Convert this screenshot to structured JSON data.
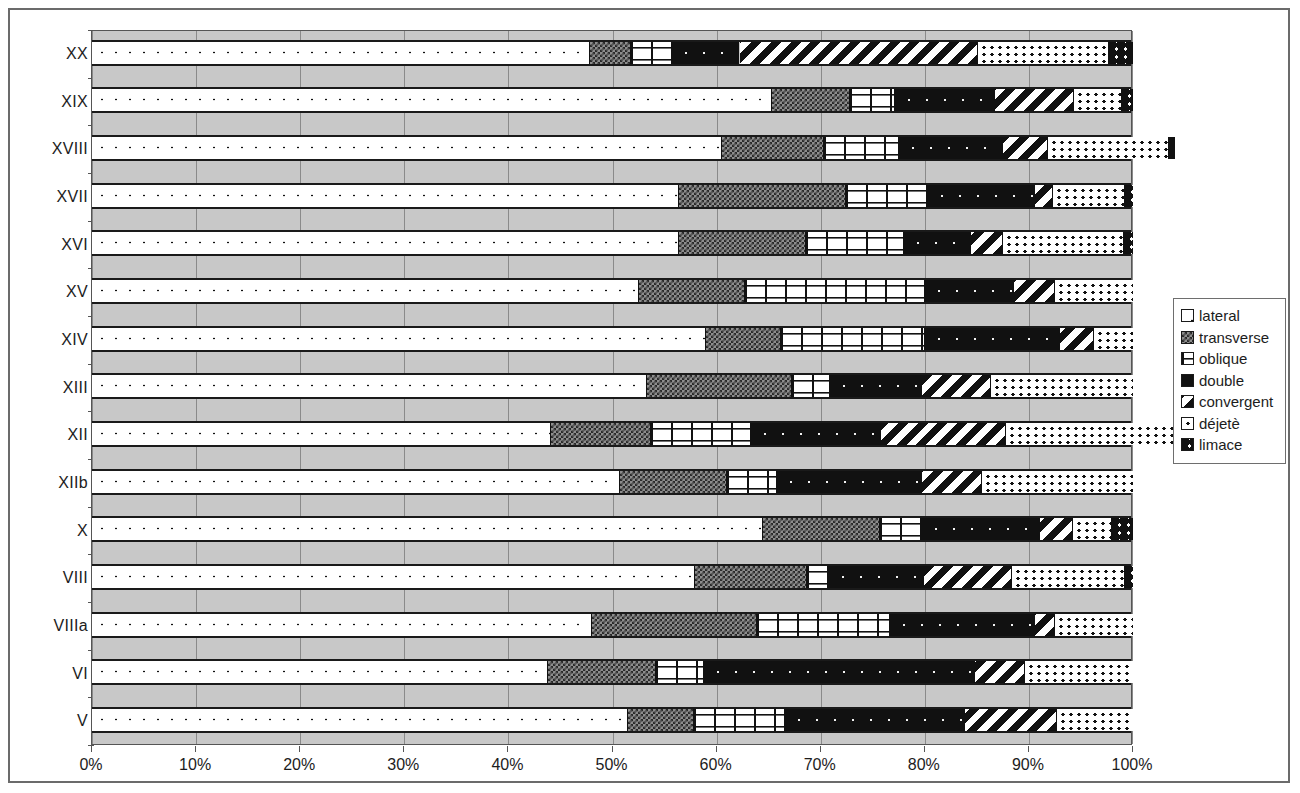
{
  "chart_data": {
    "type": "bar",
    "subtype": "stacked-percentage-horizontal",
    "title": "",
    "xlabel": "",
    "ylabel": "",
    "xlim": [
      0,
      100
    ],
    "xtick_labels": [
      "0%",
      "10%",
      "20%",
      "30%",
      "40%",
      "50%",
      "60%",
      "70%",
      "80%",
      "90%",
      "100%"
    ],
    "xticks": [
      0,
      10,
      20,
      30,
      40,
      50,
      60,
      70,
      80,
      90,
      100
    ],
    "grid": true,
    "legend_position": "right",
    "categories": [
      "XX",
      "XIX",
      "XVIII",
      "XVII",
      "XVI",
      "XV",
      "XIV",
      "XIII",
      "XII",
      "XIIb",
      "X",
      "VIII",
      "VIIIa",
      "VI",
      "V"
    ],
    "series": [
      {
        "name": "lateral",
        "pattern": "p-lateral",
        "values": [
          47.8,
          65.3,
          60.5,
          56.4,
          56.4,
          52.5,
          59.0,
          53.3,
          44.1,
          50.7,
          64.5,
          57.9,
          48.0,
          43.8,
          51.5
        ]
      },
      {
        "name": "transverse",
        "pattern": "p-transverse",
        "values": [
          4.0,
          7.5,
          9.8,
          16.0,
          12.2,
          10.2,
          7.2,
          13.9,
          9.6,
          10.3,
          11.2,
          10.8,
          15.9,
          10.4,
          6.3
        ]
      },
      {
        "name": "oblique",
        "pattern": "p-oblique",
        "values": [
          3.9,
          4.3,
          7.2,
          7.9,
          9.4,
          17.3,
          13.8,
          3.7,
          9.6,
          4.8,
          4.0,
          2.1,
          12.8,
          4.6,
          8.8
        ]
      },
      {
        "name": "double",
        "pattern": "p-double",
        "values": [
          6.5,
          9.6,
          10.0,
          10.3,
          6.4,
          8.6,
          13.0,
          8.8,
          12.5,
          13.9,
          11.4,
          9.1,
          13.9,
          26.0,
          17.3
        ]
      },
      {
        "name": "convergent",
        "pattern": "p-convergent",
        "values": [
          22.9,
          7.6,
          4.3,
          1.7,
          3.1,
          3.9,
          3.3,
          6.7,
          12.0,
          5.8,
          3.1,
          8.5,
          1.9,
          4.8,
          8.8
        ]
      },
      {
        "name": "déjetè",
        "pattern": "p-dejete",
        "values": [
          12.6,
          4.6,
          11.7,
          6.9,
          11.6,
          7.5,
          3.7,
          13.6,
          19.2,
          14.5,
          3.8,
          10.8,
          7.5,
          10.4,
          7.3
        ]
      },
      {
        "name": "limace",
        "pattern": "p-limace",
        "values": [
          2.3,
          1.1,
          0.5,
          0.8,
          0.9,
          0.0,
          0.0,
          0.0,
          3.0,
          0.0,
          2.0,
          0.8,
          0.0,
          0.0,
          0.0
        ]
      }
    ]
  },
  "legend": {
    "items": [
      {
        "label": "lateral",
        "swatch": "p-lateral"
      },
      {
        "label": "transverse",
        "swatch": "p-transverse"
      },
      {
        "label": "oblique",
        "swatch": "p-oblique"
      },
      {
        "label": "double",
        "swatch": "p-double"
      },
      {
        "label": "convergent",
        "swatch": "p-convergent"
      },
      {
        "label": "déjetè",
        "swatch": "p-dejete"
      },
      {
        "label": "limace",
        "swatch": "p-limace"
      }
    ]
  },
  "colors": {
    "plot_background": "#c8c8c8",
    "gridline": "#8a8a8a",
    "axis": "#555555",
    "ink": "#1c1c1c",
    "frame": "#6b6b6b",
    "page_background": "#ffffff"
  }
}
